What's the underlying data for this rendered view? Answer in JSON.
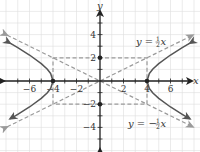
{
  "chart_data": {
    "type": "line",
    "title": "",
    "xlabel": "x",
    "ylabel": "y",
    "xlim": [
      -8,
      8
    ],
    "ylim": [
      -6.2,
      7
    ],
    "grid": true,
    "x_ticks": [
      -6,
      -4,
      -2,
      2,
      4,
      6
    ],
    "y_ticks": [
      4,
      2,
      -2,
      -4
    ],
    "x_tick_labels": [
      "−6",
      "−4",
      "−2",
      "2",
      "4",
      "6"
    ],
    "y_tick_labels": [
      "4",
      "2",
      "−2",
      "−4"
    ],
    "series": [
      {
        "name": "hyperbola",
        "equation": "x^2/16 - y^2/4 = 1",
        "style": "solid",
        "color": "#555555",
        "branches": [
          {
            "x": [
              -7.65,
              -7,
              -6,
              -5,
              -4.5,
              -4.2,
              -4,
              -4.2,
              -4.5,
              -5,
              -6,
              -7,
              -7.65
            ],
            "y": [
              3.26,
              2.87,
              2.24,
              1.5,
              1.03,
              0.64,
              0,
              -0.64,
              -1.03,
              -1.5,
              -2.24,
              -2.87,
              -3.26
            ]
          },
          {
            "x": [
              7.65,
              7,
              6,
              5,
              4.5,
              4.2,
              4,
              4.2,
              4.5,
              5,
              6,
              7,
              7.65
            ],
            "y": [
              3.26,
              2.87,
              2.24,
              1.5,
              1.03,
              0.64,
              0,
              -0.64,
              -1.03,
              -1.5,
              -2.24,
              -2.87,
              -3.26
            ]
          }
        ]
      },
      {
        "name": "y = 1/2 x",
        "style": "dashed",
        "color": "#999999",
        "x": [
          -7.9,
          7.9
        ],
        "y": [
          -3.95,
          3.95
        ]
      },
      {
        "name": "y = -1/2 x",
        "style": "dashed",
        "color": "#999999",
        "x": [
          -7.9,
          7.9
        ],
        "y": [
          3.95,
          -3.95
        ]
      },
      {
        "name": "central-rectangle",
        "style": "dashed",
        "color": "#999999",
        "x": [
          -4,
          4,
          4,
          -4,
          -4
        ],
        "y": [
          2,
          2,
          -2,
          -2,
          2
        ]
      }
    ],
    "points": [
      {
        "x": -4,
        "y": 0
      },
      {
        "x": 4,
        "y": 0
      },
      {
        "x": 0,
        "y": 2
      },
      {
        "x": 0,
        "y": -2
      }
    ],
    "annotations": [
      {
        "text": "y = ½x",
        "x": 3.2,
        "y": 3.5
      },
      {
        "text": "y = −½x",
        "x": 2.1,
        "y": -3.6
      }
    ]
  },
  "labels": {
    "x_axis": "x",
    "y_axis": "y",
    "eq_upper_prefix": "y = ",
    "eq_upper_num": "1",
    "eq_upper_den": "2",
    "eq_upper_var": "x",
    "eq_lower_prefix": "y = −",
    "eq_lower_num": "1",
    "eq_lower_den": "2",
    "eq_lower_var": "x"
  },
  "colors": {
    "grid": "#dddddd",
    "axis": "#222222",
    "curve": "#555555",
    "dashed": "#9a9a9a",
    "point": "#222222"
  }
}
